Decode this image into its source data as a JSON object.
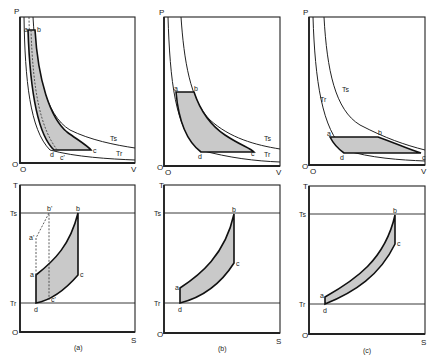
{
  "figure": {
    "panels": [
      {
        "id": "a",
        "caption": "(a)",
        "pv": {
          "y_axis": "P",
          "x_axis": "V",
          "origin": "O",
          "isotherm_labels": {
            "hot": "Ts",
            "cold": "Tr"
          },
          "points": [
            "a",
            "b",
            "c",
            "d",
            "c'"
          ]
        },
        "ts": {
          "y_axis": "T",
          "x_axis": "S",
          "origin": "O",
          "level_labels": {
            "hot": "Ts",
            "cold": "Tr"
          },
          "points": [
            "a",
            "b",
            "c",
            "d",
            "a'",
            "b'",
            "c'"
          ]
        }
      },
      {
        "id": "b",
        "caption": "(b)",
        "pv": {
          "y_axis": "P",
          "x_axis": "V",
          "origin": "O",
          "isotherm_labels": {
            "hot": "Ts",
            "cold": "Tr"
          },
          "points": [
            "a",
            "b",
            "c",
            "d"
          ]
        },
        "ts": {
          "y_axis": "T",
          "x_axis": "S",
          "origin": "O",
          "level_labels": {
            "hot": "Ts",
            "cold": "Tr"
          },
          "points": [
            "a",
            "b",
            "c",
            "d"
          ]
        }
      },
      {
        "id": "c",
        "caption": "(c)",
        "pv": {
          "y_axis": "P",
          "x_axis": "V",
          "origin": "O",
          "isotherm_labels": {
            "hot": "Ts",
            "cold": "Tr"
          },
          "points": [
            "a",
            "b",
            "c",
            "d"
          ]
        },
        "ts": {
          "y_axis": "T",
          "x_axis": "S",
          "origin": "O",
          "level_labels": {
            "hot": "Ts",
            "cold": "Tr"
          },
          "points": [
            "a",
            "b",
            "c",
            "d"
          ]
        }
      }
    ]
  }
}
